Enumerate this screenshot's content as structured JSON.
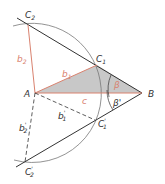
{
  "figure": {
    "colors": {
      "line": "#333333",
      "arc": "#777777",
      "red": "#d9826f",
      "triangle_fill": "#c8c8c8"
    },
    "points": {
      "A": {
        "label": "A",
        "x": 35,
        "y": 93
      },
      "B": {
        "label": "B",
        "x": 142,
        "y": 93
      },
      "C1": {
        "label": "C",
        "sub": "1",
        "x": 97,
        "y": 65
      },
      "C2": {
        "label": "C",
        "sub": "2",
        "x": 28,
        "y": 25
      },
      "C1p": {
        "label": "C",
        "sub": "1",
        "prime": "'",
        "x": 95,
        "y": 120
      },
      "C2p": {
        "label": "C",
        "sub": "2",
        "prime": "'",
        "x": 25,
        "y": 162
      }
    },
    "segments": {
      "b1": {
        "label": "b",
        "sub": "1"
      },
      "b2": {
        "label": "b",
        "sub": "2"
      },
      "c": {
        "label": "c"
      },
      "b1p": {
        "label": "b",
        "sub": "1",
        "prime": "'"
      },
      "b2p": {
        "label": "b",
        "sub": "2",
        "prime": "'"
      }
    },
    "angles": {
      "beta": {
        "label": "β"
      },
      "beta_p": {
        "label": "β'"
      }
    }
  }
}
